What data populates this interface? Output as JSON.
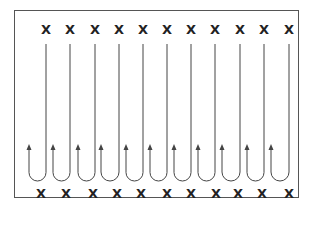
{
  "diagram": {
    "marker_glyph": "X",
    "top_markers_x": [
      46,
      70,
      95,
      119,
      143,
      167,
      191,
      215,
      240,
      264,
      289
    ],
    "top_markers_y": 29,
    "bottom_markers_x": [
      41,
      66,
      93,
      117,
      141,
      165,
      167,
      191,
      216,
      238,
      262,
      289
    ],
    "bottom_markers_y": 193,
    "loops": [
      {
        "down_x": 46,
        "up_x": 29
      },
      {
        "down_x": 70,
        "up_x": 53
      },
      {
        "down_x": 95,
        "up_x": 78
      },
      {
        "down_x": 119,
        "up_x": 101
      },
      {
        "down_x": 143,
        "up_x": 126
      },
      {
        "down_x": 167,
        "up_x": 150
      },
      {
        "down_x": 191,
        "up_x": 174
      },
      {
        "down_x": 215,
        "up_x": 198
      },
      {
        "down_x": 240,
        "up_x": 222
      },
      {
        "down_x": 264,
        "up_x": 247
      },
      {
        "down_x": 289,
        "up_x": 271
      }
    ],
    "line_top_y": 44,
    "loop_bottom_y": 181,
    "arrow_tip_y": 144,
    "stroke_color": "#444444"
  }
}
